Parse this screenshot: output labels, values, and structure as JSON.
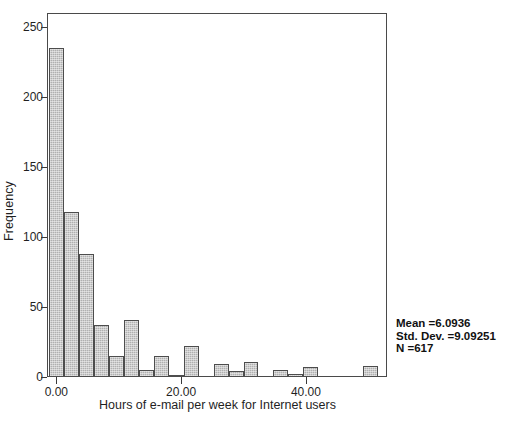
{
  "chart_data": {
    "type": "bar",
    "subtype": "histogram",
    "title": "",
    "subtitle": "",
    "xlabel": "Hours of e-mail per week for Internet users",
    "ylabel": "Frequency",
    "xlim": [
      -1.5,
      53.0
    ],
    "ylim": [
      0,
      260
    ],
    "xticks": [
      0.0,
      20.0,
      40.0
    ],
    "xtick_labels": [
      "0.00",
      "20.00",
      "40.00"
    ],
    "yticks": [
      0,
      50,
      100,
      150,
      200,
      250
    ],
    "ytick_labels": [
      "0",
      "50",
      "100",
      "150",
      "200",
      "250"
    ],
    "grid": false,
    "legend": null,
    "bin_width": 2.4,
    "bars": [
      {
        "x_left": -1.2,
        "x_right": 1.2,
        "value": 235
      },
      {
        "x_left": 1.2,
        "x_right": 3.6,
        "value": 118
      },
      {
        "x_left": 3.6,
        "x_right": 6.0,
        "value": 88
      },
      {
        "x_left": 6.0,
        "x_right": 8.4,
        "value": 37
      },
      {
        "x_left": 8.4,
        "x_right": 10.8,
        "value": 15
      },
      {
        "x_left": 10.8,
        "x_right": 13.2,
        "value": 41
      },
      {
        "x_left": 13.2,
        "x_right": 15.6,
        "value": 5
      },
      {
        "x_left": 15.6,
        "x_right": 18.0,
        "value": 15
      },
      {
        "x_left": 18.0,
        "x_right": 20.4,
        "value": 1
      },
      {
        "x_left": 20.4,
        "x_right": 22.8,
        "value": 22
      },
      {
        "x_left": 22.8,
        "x_right": 25.2,
        "value": 0
      },
      {
        "x_left": 25.2,
        "x_right": 27.6,
        "value": 9
      },
      {
        "x_left": 27.6,
        "x_right": 30.0,
        "value": 4
      },
      {
        "x_left": 30.0,
        "x_right": 32.4,
        "value": 11
      },
      {
        "x_left": 32.4,
        "x_right": 34.8,
        "value": 0
      },
      {
        "x_left": 34.8,
        "x_right": 37.2,
        "value": 5
      },
      {
        "x_left": 37.2,
        "x_right": 39.6,
        "value": 2
      },
      {
        "x_left": 39.6,
        "x_right": 42.0,
        "value": 7
      },
      {
        "x_left": 42.0,
        "x_right": 44.4,
        "value": 0
      },
      {
        "x_left": 44.4,
        "x_right": 46.8,
        "value": 0
      },
      {
        "x_left": 46.8,
        "x_right": 49.2,
        "value": 0
      },
      {
        "x_left": 49.2,
        "x_right": 51.6,
        "value": 8
      }
    ],
    "categories": [
      "-1.2 to 1.2",
      "1.2 to 3.6",
      "3.6 to 6.0",
      "6.0 to 8.4",
      "8.4 to 10.8",
      "10.8 to 13.2",
      "13.2 to 15.6",
      "15.6 to 18.0",
      "18.0 to 20.4",
      "20.4 to 22.8",
      "22.8 to 25.2",
      "25.2 to 27.6",
      "27.6 to 30.0",
      "30.0 to 32.4",
      "32.4 to 34.8",
      "34.8 to 37.2",
      "37.2 to 39.6",
      "39.6 to 42.0",
      "42.0 to 44.4",
      "44.4 to 46.8",
      "46.8 to 49.2",
      "49.2 to 51.6"
    ],
    "values": [
      235,
      118,
      88,
      37,
      15,
      41,
      5,
      15,
      1,
      22,
      0,
      9,
      4,
      11,
      0,
      5,
      2,
      7,
      0,
      0,
      0,
      8
    ],
    "bar_color": "#b0b0b0",
    "bar_edge_color": "#4d4d4d",
    "annotations": {
      "mean_label": "Mean =6.0936",
      "std_dev_label": "Std. Dev. =9.09251",
      "n_label": "N =617",
      "mean_value": 6.0936,
      "std_dev_value": 9.09251,
      "n_value": 617
    }
  }
}
